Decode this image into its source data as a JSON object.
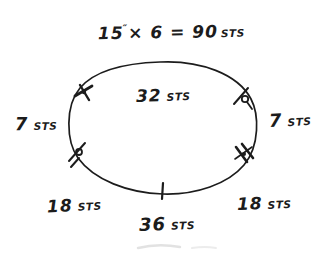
{
  "canvas": {
    "background": "#ffffff",
    "ink": "#1c1c1c",
    "faint": "#c4c4c4",
    "description": "hand-drawn circular knitting schematic with stitch counts"
  },
  "formula": {
    "measurement": "15",
    "inch_mark": "″",
    "expression": "× 6  =  90",
    "unit": "STS"
  },
  "stitch_labels": {
    "inside_top": {
      "value": "32",
      "unit": "STS"
    },
    "left": {
      "value": "7",
      "unit": "STS"
    },
    "right": {
      "value": "7",
      "unit": "STS"
    },
    "bottom_left": {
      "value": "18",
      "unit": "STS"
    },
    "bottom_right": {
      "value": "18",
      "unit": "STS"
    },
    "bottom_center": {
      "value": "36",
      "unit": "STS"
    }
  },
  "tick_marks": [
    {
      "position": "upper-left",
      "style": "double-hash"
    },
    {
      "position": "upper-right",
      "style": "slash-with-loop"
    },
    {
      "position": "lower-left",
      "style": "slash-with-loop"
    },
    {
      "position": "lower-right",
      "style": "double-hash"
    },
    {
      "position": "bottom-center",
      "style": "single-tick"
    }
  ]
}
